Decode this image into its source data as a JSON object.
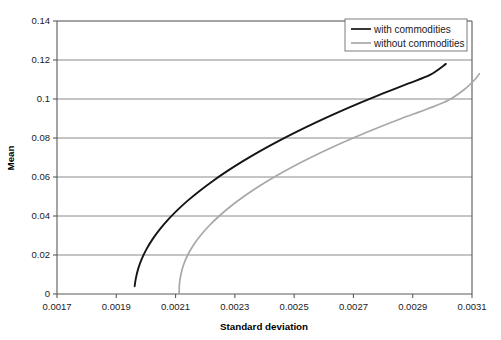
{
  "chart_data": {
    "type": "line",
    "title": "",
    "xlabel": "Standard deviation",
    "ylabel": "Mean",
    "xlim": [
      0.0017,
      0.0031
    ],
    "ylim": [
      0,
      0.14
    ],
    "grid": "horizontal",
    "legend_position": "top-right",
    "x_ticks": [
      "0.0017",
      "0.0019",
      "0.0021",
      "0.0023",
      "0.0025",
      "0.0027",
      "0.0029",
      "0.0031"
    ],
    "x_tick_values": [
      0.0017,
      0.0019,
      0.0021,
      0.0023,
      0.0025,
      0.0027,
      0.0029,
      0.0031
    ],
    "y_ticks": [
      "0",
      "0.02",
      "0.04",
      "0.06",
      "0.08",
      "0.1",
      "0.12",
      "0.14"
    ],
    "y_tick_values": [
      0,
      0.02,
      0.04,
      0.06,
      0.08,
      0.1,
      0.12,
      0.14
    ],
    "series": [
      {
        "name": "with commodities",
        "color": "#151515",
        "width": 1.9,
        "points": [
          [
            0.001962,
            0.004
          ],
          [
            0.001966,
            0.008
          ],
          [
            0.001974,
            0.013
          ],
          [
            0.001986,
            0.018
          ],
          [
            0.002002,
            0.023
          ],
          [
            0.002022,
            0.028
          ],
          [
            0.002046,
            0.033
          ],
          [
            0.002074,
            0.038
          ],
          [
            0.002106,
            0.043
          ],
          [
            0.002142,
            0.048
          ],
          [
            0.002182,
            0.053
          ],
          [
            0.002226,
            0.058
          ],
          [
            0.002274,
            0.063
          ],
          [
            0.002326,
            0.068
          ],
          [
            0.002382,
            0.073
          ],
          [
            0.002442,
            0.078
          ],
          [
            0.002506,
            0.083
          ],
          [
            0.002574,
            0.088
          ],
          [
            0.002646,
            0.093
          ],
          [
            0.002722,
            0.098
          ],
          [
            0.002802,
            0.103
          ],
          [
            0.002886,
            0.108
          ],
          [
            0.00296,
            0.1125
          ],
          [
            0.003012,
            0.118
          ]
        ]
      },
      {
        "name": "without commodities",
        "color": "#a8a8a8",
        "width": 1.7,
        "points": [
          [
            0.002112,
            0.0
          ],
          [
            0.002113,
            0.005
          ],
          [
            0.002118,
            0.01
          ],
          [
            0.002127,
            0.015
          ],
          [
            0.002141,
            0.02
          ],
          [
            0.00216,
            0.025
          ],
          [
            0.002184,
            0.03
          ],
          [
            0.002213,
            0.035
          ],
          [
            0.002247,
            0.04
          ],
          [
            0.002286,
            0.045
          ],
          [
            0.00233,
            0.05
          ],
          [
            0.002379,
            0.055
          ],
          [
            0.002433,
            0.06
          ],
          [
            0.002492,
            0.065
          ],
          [
            0.002556,
            0.07
          ],
          [
            0.002625,
            0.075
          ],
          [
            0.002699,
            0.08
          ],
          [
            0.002778,
            0.085
          ],
          [
            0.002862,
            0.09
          ],
          [
            0.002951,
            0.095
          ],
          [
            0.003022,
            0.0995
          ],
          [
            0.003075,
            0.105
          ],
          [
            0.00311,
            0.11
          ],
          [
            0.003125,
            0.113
          ]
        ]
      }
    ]
  },
  "legend": {
    "items": [
      {
        "label": "with commodities"
      },
      {
        "label": "without commodities"
      }
    ]
  },
  "axis_titles": {
    "x": "Standard deviation",
    "y": "Mean"
  }
}
